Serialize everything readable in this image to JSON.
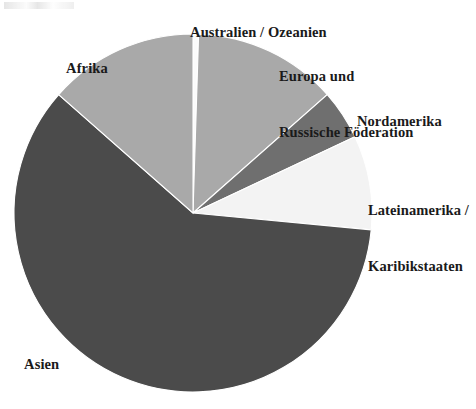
{
  "figure": {
    "width": 476,
    "height": 409,
    "background": "#ffffff"
  },
  "chart_data": {
    "type": "pie",
    "title": "",
    "subtitle": "",
    "xlabel": "",
    "ylabel": "",
    "legend_position": "none",
    "grid": false,
    "label_unit": "%",
    "start_angle_deg": 0,
    "direction": "clockwise",
    "center": {
      "x": 193,
      "y": 213
    },
    "radius": 179,
    "categories": [
      "Australien / Ozeanien",
      "Europa und Russische Föderation",
      "Nordamerika",
      "Lateinamerika / Karibikstaaten",
      "Asien",
      "Afrika"
    ],
    "values": [
      0.5,
      13.0,
      4.5,
      8.5,
      60.0,
      13.5
    ],
    "slices": [
      {
        "name": "australien-ozeanien",
        "label": "Australien / Ozeanien",
        "label_lines": [
          "Australien / Ozeanien"
        ],
        "value": 0.5,
        "color": "#fbfbfb",
        "start_deg": 0,
        "end_deg": 1.8
      },
      {
        "name": "europa-russische-foederation",
        "label": "Europa und Russische Föderation",
        "label_lines": [
          "Europa und",
          "Russische Föderation"
        ],
        "value": 13.0,
        "color": "#a9a9a9",
        "start_deg": 1.8,
        "end_deg": 48.6
      },
      {
        "name": "nordamerika",
        "label": "Nordamerika",
        "label_lines": [
          "Nordamerika"
        ],
        "value": 4.5,
        "color": "#6f6f6f",
        "start_deg": 48.6,
        "end_deg": 64.8
      },
      {
        "name": "lateinamerika-karibikstaaten",
        "label": "Lateinamerika / Karibikstaaten",
        "label_lines": [
          "Lateinamerika /",
          "Karibikstaaten"
        ],
        "value": 8.5,
        "color": "#f3f3f3",
        "start_deg": 64.8,
        "end_deg": 95.4
      },
      {
        "name": "asien",
        "label": "Asien",
        "label_lines": [
          "Asien"
        ],
        "value": 60.0,
        "color": "#4b4b4b",
        "start_deg": 95.4,
        "end_deg": 311.4
      },
      {
        "name": "afrika",
        "label": "Afrika",
        "label_lines": [
          "Afrika"
        ],
        "value": 13.5,
        "color": "#a9a9a9",
        "start_deg": 311.4,
        "end_deg": 360
      }
    ]
  },
  "labels": {
    "australien": "Australien / Ozeanien",
    "europa_line1": "Europa und",
    "europa_line2": "Russische Föderation",
    "nordamerika": "Nordamerika",
    "lateinamerika_line1": "Lateinamerika /",
    "lateinamerika_line2": "Karibikstaaten",
    "afrika": "Afrika",
    "asien": "Asien"
  },
  "colors": {
    "dark_gray": "#4b4b4b",
    "mid_gray": "#6f6f6f",
    "light_gray": "#a9a9a9",
    "near_white": "#f3f3f3",
    "text": "#1a1a1a",
    "outline": "#ffffff"
  }
}
